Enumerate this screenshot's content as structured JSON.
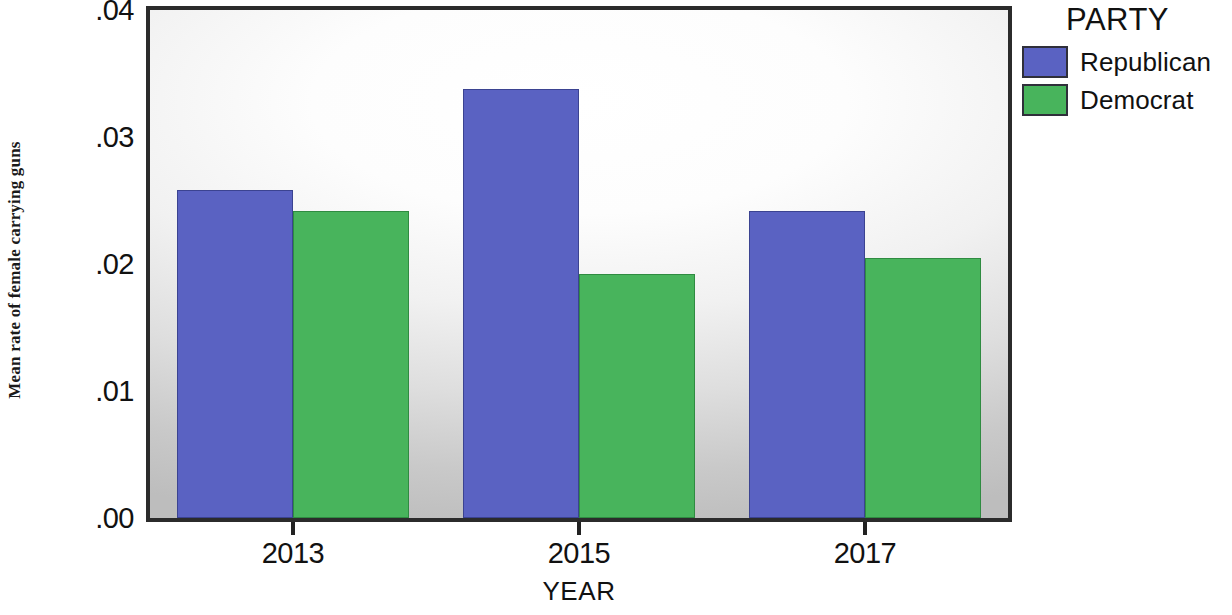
{
  "chart_data": {
    "type": "bar",
    "title": "",
    "subtitle": "",
    "xlabel": "YEAR",
    "ylabel": "Mean rate of female carrying guns",
    "categories": [
      "2013",
      "2015",
      "2017"
    ],
    "series": [
      {
        "name": "Republican",
        "color": "#5a62c2",
        "values": [
          0.0258,
          0.0338,
          0.0242
        ]
      },
      {
        "name": "Democrat",
        "color": "#48b45c",
        "values": [
          0.0242,
          0.0192,
          0.0205
        ]
      }
    ],
    "ylim": [
      0.0,
      0.04
    ],
    "ytick_values": [
      0.04,
      0.03,
      0.02,
      0.01,
      0.0
    ],
    "ytick_labels": [
      ".04",
      ".03",
      ".02",
      ".01",
      ".00"
    ],
    "grid": false,
    "legend_position": "right",
    "legend_title": "PARTY"
  },
  "legend": {
    "title": "PARTY",
    "entries": [
      {
        "label": "Republican",
        "swatch": "republican"
      },
      {
        "label": "Democrat",
        "swatch": "democrat"
      }
    ]
  },
  "axes": {
    "y_title": "Mean rate of female carrying guns",
    "x_title": "YEAR"
  }
}
